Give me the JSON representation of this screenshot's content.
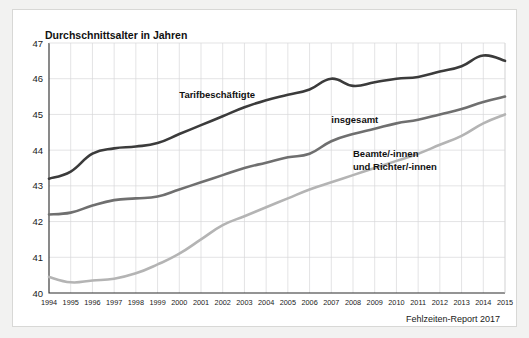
{
  "figure": {
    "title": "Durchschnittsalter in Jahren",
    "source": "Fehlzeiten-Report 2017",
    "background": "#ffffff",
    "page_background": "#f2f2f1"
  },
  "chart_data": {
    "type": "line",
    "title": "Durchschnittsalter in Jahren",
    "xlabel": "",
    "ylabel": "Durchschnittsalter in Jahren",
    "ylim": [
      40,
      47
    ],
    "xlim": [
      1994,
      2015
    ],
    "yticks": [
      "40",
      "41",
      "42",
      "43",
      "44",
      "45",
      "46",
      "47"
    ],
    "grid": true,
    "legend_position": "inline-annotations",
    "categories": [
      "1994",
      "1995",
      "1996",
      "1997",
      "1998",
      "1999",
      "2000",
      "2001",
      "2002",
      "2003",
      "2004",
      "2005",
      "2006",
      "2007",
      "2008",
      "2009",
      "2010",
      "2011",
      "2012",
      "2013",
      "2014",
      "2015"
    ],
    "series": [
      {
        "name": "Tarifbeschäftigte",
        "color": "#3b3b3b",
        "width": 2.6,
        "label_x": 2000,
        "label_y": 45.45,
        "values": [
          43.2,
          43.4,
          43.9,
          44.05,
          44.1,
          44.2,
          44.45,
          44.7,
          44.95,
          45.2,
          45.4,
          45.55,
          45.7,
          46.0,
          45.8,
          45.9,
          46.0,
          46.05,
          46.2,
          46.35,
          46.65,
          46.5
        ]
      },
      {
        "name": "insgesamt",
        "color": "#6f6f6f",
        "width": 2.6,
        "label_x": 2007,
        "label_y": 44.75,
        "values": [
          42.2,
          42.25,
          42.45,
          42.6,
          42.65,
          42.7,
          42.9,
          43.1,
          43.3,
          43.5,
          43.65,
          43.8,
          43.9,
          44.25,
          44.45,
          44.6,
          44.75,
          44.85,
          45.0,
          45.15,
          45.35,
          45.5
        ]
      },
      {
        "name": "Beamte/-innen und Richter/-innen",
        "color": "#b4b4b4",
        "width": 2.6,
        "label_x": 2008,
        "label_y": 43.72,
        "values": [
          40.45,
          40.3,
          40.35,
          40.4,
          40.55,
          40.8,
          41.1,
          41.5,
          41.9,
          42.15,
          42.4,
          42.65,
          42.9,
          43.1,
          43.3,
          43.5,
          43.7,
          43.9,
          44.15,
          44.4,
          44.75,
          45.0
        ]
      }
    ],
    "annotations": [
      {
        "text": "Tarifbeschäftigte",
        "x": 2000,
        "y": 45.45
      },
      {
        "text": "insgesamt",
        "x": 2007,
        "y": 44.75
      },
      {
        "text": "Beamte/-innen",
        "x": 2008,
        "y": 43.82
      },
      {
        "text": "und Richter/-innen",
        "x": 2008,
        "y": 43.45
      }
    ]
  }
}
